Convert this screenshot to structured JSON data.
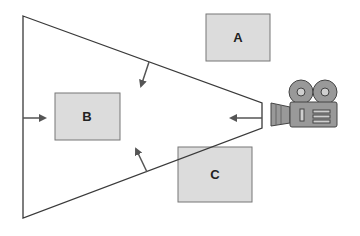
{
  "diagram": {
    "type": "camera-view-frustum",
    "colors": {
      "stroke": "#3a3a3a",
      "arrow": "#555555",
      "box_fill": "#dcdcdc",
      "box_stroke": "#777777",
      "camera_fill": "#999999",
      "camera_stroke": "#444444",
      "camera_light": "#cfcfcf"
    },
    "boxes": [
      {
        "id": "A",
        "label": "A",
        "x": 206,
        "y": 14,
        "w": 64,
        "h": 47
      },
      {
        "id": "B",
        "label": "B",
        "x": 55,
        "y": 93,
        "w": 65,
        "h": 47
      },
      {
        "id": "C",
        "label": "C",
        "x": 178,
        "y": 147,
        "w": 74,
        "h": 55
      }
    ],
    "frustum": {
      "points": [
        [
          23,
          16
        ],
        [
          262,
          103
        ],
        [
          262,
          128
        ],
        [
          23,
          218
        ]
      ]
    },
    "arrows": [
      {
        "name": "left-plane-arrow",
        "from": [
          23,
          118
        ],
        "to": [
          45,
          118
        ]
      },
      {
        "name": "right-plane-arrow",
        "from": [
          262,
          118
        ],
        "to": [
          230,
          118
        ]
      },
      {
        "name": "top-plane-arrow",
        "from": [
          149,
          62
        ],
        "to": [
          140,
          87
        ]
      },
      {
        "name": "bottom-plane-arrow",
        "from": [
          147,
          172
        ],
        "to": [
          135,
          148
        ]
      }
    ],
    "camera": {
      "icon": "movie-camera-icon"
    }
  }
}
